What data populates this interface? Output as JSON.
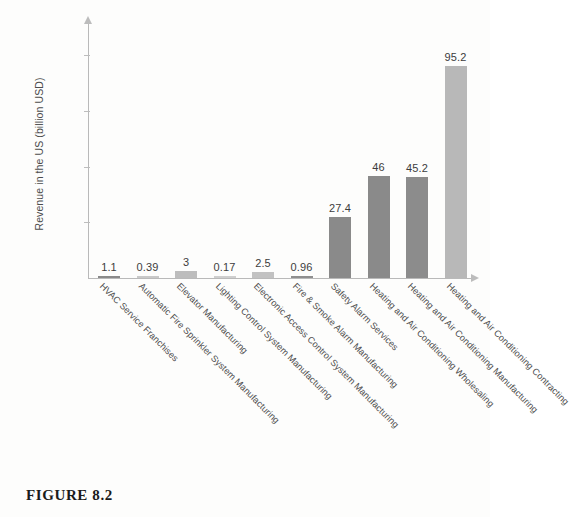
{
  "figure": {
    "caption": "FIGURE 8.2"
  },
  "chart_data": {
    "type": "bar",
    "title": "",
    "xlabel": "",
    "ylabel": "Revenue in the US (billion USD)",
    "ylim": [
      0,
      115
    ],
    "yticks": [
      25,
      50,
      75,
      100
    ],
    "grid": false,
    "legend": null,
    "categories": [
      "HVAC Service Franchises",
      "Automatic Fire Sprinkler System Manufacturing",
      "Elevator Manufacturing",
      "Lighting Control System Manufacturing",
      "Electronic Access Control System Manufacturing",
      "Fire & Smoke Alarm Manufacturing",
      "Safety Alarm Services",
      "Heating and Air Conditioning Wholesaling",
      "Heating and Air Conditioning Manufacturing",
      "Heating and Air Conditioning Contracting"
    ],
    "values": [
      1.1,
      0.39,
      3,
      0.17,
      2.5,
      0.96,
      27.4,
      46,
      45.2,
      95.2
    ],
    "value_labels": [
      "1.1",
      "0.39",
      "3",
      "0.17",
      "2.5",
      "0.96",
      "27.4",
      "46",
      "45.2",
      "95.2"
    ],
    "bar_colors": [
      "#8a8a8a",
      "#c9c9c9",
      "#bdbdbd",
      "#cfcfcf",
      "#c2c2c2",
      "#8f8f8f",
      "#8a8a8a",
      "#8a8a8a",
      "#8c8c8c",
      "#b8b8b8"
    ]
  },
  "axes": {
    "y_tick_labels": [
      "100",
      "75",
      "50",
      "25"
    ],
    "axis_color": "#b9b9b9"
  }
}
